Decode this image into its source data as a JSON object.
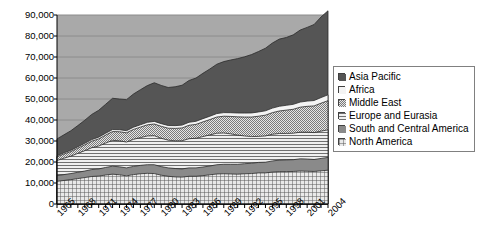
{
  "chart_data": {
    "type": "area",
    "title": "",
    "xlabel": "",
    "ylabel": "",
    "stacked": true,
    "grid": true,
    "legend_position": "right",
    "ylim": [
      0,
      90000
    ],
    "yticks": [
      "0",
      "10,000",
      "20,000",
      "30,000",
      "40,000",
      "50,000",
      "60,000",
      "70,000",
      "80,000",
      "90,000"
    ],
    "ytick_values": [
      0,
      10000,
      20000,
      30000,
      40000,
      50000,
      60000,
      70000,
      80000,
      90000
    ],
    "xlim": [
      1965,
      2004
    ],
    "xticks": [
      "1965",
      "1968",
      "1971",
      "1974",
      "1977",
      "1980",
      "1983",
      "1986",
      "1989",
      "1992",
      "1995",
      "1998",
      "2001",
      "2004"
    ],
    "xtick_values": [
      1965,
      1968,
      1971,
      1974,
      1977,
      1980,
      1983,
      1986,
      1989,
      1992,
      1995,
      1998,
      2001,
      2004
    ],
    "x": [
      1965,
      1966,
      1967,
      1968,
      1969,
      1970,
      1971,
      1972,
      1973,
      1974,
      1975,
      1976,
      1977,
      1978,
      1979,
      1980,
      1981,
      1982,
      1983,
      1984,
      1985,
      1986,
      1987,
      1988,
      1989,
      1990,
      1991,
      1992,
      1993,
      1994,
      1995,
      1996,
      1997,
      1998,
      1999,
      2000,
      2001,
      2002,
      2003,
      2004
    ],
    "series": [
      {
        "name": "North America",
        "pattern": "grid-crosshatch",
        "color": "#d8d8d8",
        "values": [
          10800,
          11200,
          11600,
          12100,
          12600,
          13100,
          13300,
          13800,
          14200,
          13900,
          13400,
          14000,
          14400,
          14600,
          14500,
          13700,
          13200,
          12900,
          12800,
          13200,
          13200,
          13500,
          13900,
          14300,
          14400,
          14300,
          14200,
          14400,
          14500,
          14800,
          14800,
          15200,
          15400,
          15400,
          15500,
          15700,
          15600,
          15500,
          15800,
          16100
        ]
      },
      {
        "name": "South and Central America",
        "pattern": "solid-gray",
        "color": "#8a8a8a",
        "values": [
          2700,
          2800,
          2900,
          3000,
          3100,
          3300,
          3400,
          3600,
          3800,
          3800,
          3800,
          3900,
          4000,
          4100,
          4200,
          4100,
          4000,
          4000,
          3900,
          4000,
          4000,
          4100,
          4200,
          4400,
          4500,
          4600,
          4700,
          4800,
          4900,
          5000,
          5100,
          5300,
          5500,
          5600,
          5600,
          5800,
          5800,
          5700,
          5900,
          6100
        ]
      },
      {
        "name": "Europe and Eurasia",
        "pattern": "horizontal-lines",
        "color": "#e4e4e4",
        "values": [
          7200,
          7800,
          8300,
          9000,
          9700,
          10400,
          10900,
          11600,
          12300,
          12400,
          12300,
          12900,
          13200,
          13700,
          13800,
          13500,
          13200,
          13200,
          13400,
          13900,
          14100,
          14500,
          14800,
          15000,
          14900,
          14500,
          13900,
          13200,
          12700,
          12400,
          12500,
          12700,
          12700,
          12600,
          12600,
          12700,
          12800,
          12800,
          13000,
          13100
        ]
      },
      {
        "name": "Middle East",
        "pattern": "fine-checker",
        "color": "#c4c4c4",
        "values": [
          1800,
          2000,
          2200,
          2500,
          2800,
          3100,
          3400,
          3800,
          4200,
          4300,
          4400,
          4700,
          5000,
          5300,
          5600,
          5700,
          5700,
          5900,
          6100,
          6400,
          6600,
          7000,
          7300,
          7700,
          8000,
          8300,
          8700,
          9000,
          9300,
          9600,
          9900,
          10300,
          10700,
          11100,
          11400,
          11900,
          12300,
          12700,
          13300,
          13900
        ]
      },
      {
        "name": "Africa",
        "pattern": "light-plain",
        "color": "#f2f2f2",
        "values": [
          500,
          550,
          600,
          650,
          700,
          760,
          820,
          880,
          950,
          980,
          1000,
          1060,
          1120,
          1180,
          1240,
          1270,
          1280,
          1320,
          1360,
          1420,
          1470,
          1540,
          1600,
          1660,
          1720,
          1780,
          1840,
          1900,
          1960,
          2020,
          2080,
          2160,
          2240,
          2300,
          2360,
          2440,
          2500,
          2570,
          2680,
          2800
        ]
      },
      {
        "name": "Asia Pacific",
        "pattern": "dark-gray",
        "color": "#555555",
        "values": [
          8000,
          8600,
          9300,
          10100,
          11000,
          12000,
          12800,
          13800,
          14900,
          14600,
          14800,
          15800,
          16700,
          17500,
          18400,
          18200,
          18100,
          18500,
          19000,
          19900,
          20600,
          21600,
          22500,
          23500,
          24300,
          25100,
          25900,
          26800,
          27800,
          28800,
          29800,
          31000,
          32000,
          32300,
          33100,
          34300,
          35100,
          36200,
          38400,
          40000
        ]
      }
    ]
  },
  "legend": {
    "items": [
      {
        "label": "Asia Pacific",
        "swatch": "dark-gray"
      },
      {
        "label": "Africa",
        "swatch": "light-plain"
      },
      {
        "label": "Middle East",
        "swatch": "fine-checker"
      },
      {
        "label": "Europe and Eurasia",
        "swatch": "horizontal-lines"
      },
      {
        "label": "South and Central America",
        "swatch": "solid-gray"
      },
      {
        "label": "North America",
        "swatch": "grid-crosshatch"
      }
    ]
  },
  "colors": {
    "plot_background": "#a9a9a9",
    "gridline": "#8c8c8c",
    "axis": "#000000",
    "page_background": "#ffffff",
    "legend_border": "#808080"
  }
}
